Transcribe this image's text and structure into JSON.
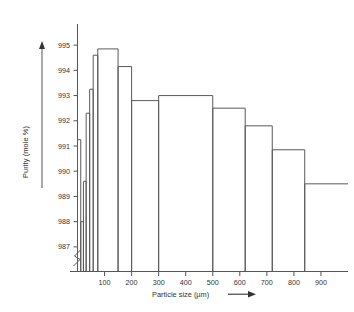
{
  "chart_data": {
    "type": "bar",
    "title": "",
    "subtitle": "",
    "xlabel": "Particle size  (µm)",
    "ylabel": "Purity (mole %)",
    "xlim": [
      0,
      1000
    ],
    "ylim": [
      986.4,
      995.6
    ],
    "grid": false,
    "legend": null,
    "y_axis_break": true,
    "y_axis_break_note": "zig-zag break symbol on vertical axis just above the origin, below 987",
    "x_ticks": [
      100,
      200,
      300,
      400,
      500,
      600,
      700,
      800,
      900
    ],
    "x_tick_labels": [
      "100",
      "200",
      "300",
      "400",
      "500",
      "600",
      "700",
      "800",
      "900"
    ],
    "y_ticks": [
      987,
      988,
      989,
      990,
      991,
      992,
      993,
      994,
      995
    ],
    "y_tick_labels": [
      "987",
      "988",
      "989",
      "990",
      "991",
      "992",
      "993",
      "994",
      "995"
    ],
    "series": [
      {
        "name": "Purity vs particle size",
        "bins": [
          {
            "x_start": 0,
            "x_end": 12,
            "value": 991.25
          },
          {
            "x_start": 12,
            "x_end": 22,
            "value": 988.0
          },
          {
            "x_start": 22,
            "x_end": 32,
            "value": 989.6
          },
          {
            "x_start": 32,
            "x_end": 45,
            "value": 992.3
          },
          {
            "x_start": 45,
            "x_end": 58,
            "value": 993.25
          },
          {
            "x_start": 58,
            "x_end": 75,
            "value": 994.6
          },
          {
            "x_start": 75,
            "x_end": 150,
            "value": 994.85
          },
          {
            "x_start": 150,
            "x_end": 200,
            "value": 994.15
          },
          {
            "x_start": 200,
            "x_end": 300,
            "value": 992.8
          },
          {
            "x_start": 300,
            "x_end": 500,
            "value": 993.0
          },
          {
            "x_start": 500,
            "x_end": 620,
            "value": 992.5
          },
          {
            "x_start": 620,
            "x_end": 720,
            "value": 991.8
          },
          {
            "x_start": 720,
            "x_end": 840,
            "value": 990.85
          },
          {
            "x_start": 840,
            "x_end": 1000,
            "value": 989.5
          }
        ],
        "categories": [
          "0-12",
          "12-22",
          "22-32",
          "32-45",
          "45-58",
          "58-75",
          "75-150",
          "150-200",
          "200-300",
          "300-500",
          "500-620",
          "620-720",
          "720-840",
          "840+"
        ],
        "values": [
          991.25,
          988.0,
          989.6,
          992.3,
          993.25,
          994.6,
          994.85,
          994.15,
          992.8,
          993.0,
          992.5,
          991.8,
          990.85,
          989.5
        ]
      }
    ],
    "annotations": [
      {
        "name": "x-axis-arrow",
        "text": "→",
        "position": "end of x axis title"
      },
      {
        "name": "y-axis-arrow",
        "text": "↑",
        "position": "top of y axis title rule"
      }
    ],
    "colors": {
      "line": "#5a5a5a",
      "axis": "#555555",
      "text": "#333333",
      "background": "#ffffff"
    }
  }
}
